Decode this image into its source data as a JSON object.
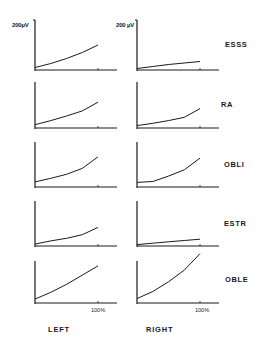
{
  "figure": {
    "y_unit_label_left": "200µV",
    "y_unit_label_right": "200 µV",
    "x_tick_label": "100%",
    "columns": [
      "LEFT",
      "RIGHT"
    ],
    "rows": [
      "ESSS",
      "RA",
      "OBLI",
      "ESTR",
      "OBLE"
    ],
    "line_color": "#1a1a1a"
  },
  "chart_data": {
    "type": "line",
    "title": "",
    "layout": "5 rows (muscles) x 2 columns (sides) small multiples",
    "xlabel": "% effort",
    "ylabel": "EMG amplitude (µV)",
    "xlim": [
      0,
      130
    ],
    "ylim": [
      0,
      200
    ],
    "x_ticks": [
      "100%"
    ],
    "y_ticks": [
      "200µV"
    ],
    "x": [
      0,
      25,
      50,
      75,
      100
    ],
    "panels": [
      {
        "muscle": "ESSS",
        "side": "LEFT",
        "values": [
          6,
          22,
          42,
          66,
          96
        ]
      },
      {
        "muscle": "ESSS",
        "side": "RIGHT",
        "values": [
          2,
          10,
          18,
          24,
          30
        ]
      },
      {
        "muscle": "RA",
        "side": "LEFT",
        "values": [
          10,
          28,
          48,
          70,
          108
        ]
      },
      {
        "muscle": "RA",
        "side": "RIGHT",
        "values": [
          6,
          16,
          28,
          42,
          80
        ]
      },
      {
        "muscle": "OBLI",
        "side": "LEFT",
        "values": [
          18,
          34,
          52,
          78,
          130
        ]
      },
      {
        "muscle": "OBLI",
        "side": "RIGHT",
        "values": [
          16,
          20,
          44,
          72,
          124
        ]
      },
      {
        "muscle": "ESTR",
        "side": "LEFT",
        "values": [
          4,
          18,
          30,
          46,
          78
        ]
      },
      {
        "muscle": "ESTR",
        "side": "RIGHT",
        "values": [
          2,
          8,
          14,
          20,
          26
        ]
      },
      {
        "muscle": "OBLE",
        "side": "LEFT",
        "values": [
          14,
          46,
          84,
          128,
          172
        ]
      },
      {
        "muscle": "OBLE",
        "side": "RIGHT",
        "values": [
          16,
          50,
          96,
          152,
          230
        ]
      }
    ]
  }
}
